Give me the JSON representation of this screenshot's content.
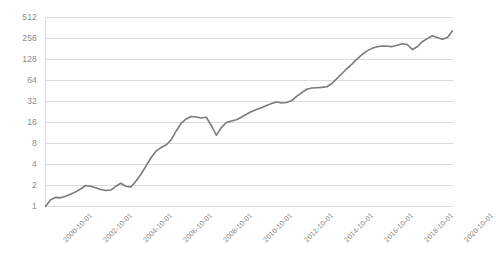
{
  "chart_data": {
    "type": "line",
    "title": "",
    "subtitle": "",
    "xlabel": "",
    "ylabel": "",
    "grid": true,
    "legend": false,
    "yscale": "log2",
    "ylim": [
      1,
      512
    ],
    "yticks": [
      1,
      2,
      4,
      8,
      16,
      32,
      64,
      128,
      256,
      512
    ],
    "ytick_labels": [
      "1",
      "2",
      "4",
      "8",
      "16",
      "32",
      "64",
      "128",
      "256",
      "512"
    ],
    "xtick_labels": [
      "2000-10-01",
      "2002-10-01",
      "2004-10-01",
      "2006-10-01",
      "2008-10-01",
      "2010-10-01",
      "2012-10-01",
      "2014-10-01",
      "2016-10-01",
      "2018-10-01",
      "2020-10-01"
    ],
    "xlim": [
      "2000-10-01",
      "2021-01-01"
    ],
    "series": [
      {
        "name": "value",
        "color": "#7a7a7a",
        "x": [
          "2000-10-01",
          "2001-01-01",
          "2001-04-01",
          "2001-07-01",
          "2001-10-01",
          "2002-01-01",
          "2002-04-01",
          "2002-07-01",
          "2002-10-01",
          "2003-01-01",
          "2003-04-01",
          "2003-07-01",
          "2003-10-01",
          "2004-01-01",
          "2004-04-01",
          "2004-07-01",
          "2004-10-01",
          "2005-01-01",
          "2005-04-01",
          "2005-07-01",
          "2005-10-01",
          "2006-01-01",
          "2006-04-01",
          "2006-07-01",
          "2006-10-01",
          "2007-01-01",
          "2007-04-01",
          "2007-07-01",
          "2007-10-01",
          "2008-01-01",
          "2008-04-01",
          "2008-07-01",
          "2008-10-01",
          "2009-01-01",
          "2009-04-01",
          "2009-07-01",
          "2009-10-01",
          "2010-01-01",
          "2010-04-01",
          "2010-07-01",
          "2010-10-01",
          "2011-01-01",
          "2011-04-01",
          "2011-07-01",
          "2011-10-01",
          "2012-01-01",
          "2012-04-01",
          "2012-07-01",
          "2012-10-01",
          "2013-01-01",
          "2013-04-01",
          "2013-07-01",
          "2013-10-01",
          "2014-01-01",
          "2014-04-01",
          "2014-07-01",
          "2014-10-01",
          "2015-01-01",
          "2015-04-01",
          "2015-07-01",
          "2015-10-01",
          "2016-01-01",
          "2016-04-01",
          "2016-07-01",
          "2016-10-01",
          "2017-01-01",
          "2017-04-01",
          "2017-07-01",
          "2017-10-01",
          "2018-01-01",
          "2018-04-01",
          "2018-07-01",
          "2018-10-01",
          "2019-01-01",
          "2019-04-01",
          "2019-07-01",
          "2019-10-01",
          "2020-01-01",
          "2020-04-01",
          "2020-07-01",
          "2020-10-01",
          "2021-01-01"
        ],
        "values": [
          1.0,
          1.25,
          1.35,
          1.33,
          1.4,
          1.5,
          1.62,
          1.78,
          2.0,
          1.95,
          1.85,
          1.75,
          1.7,
          1.72,
          1.95,
          2.15,
          1.95,
          1.9,
          2.3,
          2.9,
          3.8,
          5.0,
          6.2,
          7.0,
          7.6,
          9.0,
          12.0,
          15.5,
          18.0,
          19.5,
          19.2,
          18.6,
          19.0,
          14.5,
          10.5,
          13.5,
          16.0,
          16.8,
          17.5,
          19.0,
          21.0,
          23.0,
          24.5,
          26.0,
          28.0,
          30.0,
          31.5,
          30.5,
          31.0,
          33.0,
          38.0,
          43.0,
          48.0,
          50.0,
          50.5,
          51.0,
          52.0,
          58.0,
          68.0,
          80.0,
          95.0,
          110.0,
          130.0,
          150.0,
          170.0,
          185.0,
          195.0,
          200.0,
          198.0,
          196.0,
          205.0,
          215.0,
          210.0,
          178.0,
          195.0,
          230.0,
          255.0,
          280.0,
          265.0,
          250.0,
          265.0,
          330.0
        ]
      }
    ]
  },
  "axes": {
    "y_tick_labels": [
      "512",
      "256",
      "128",
      "64",
      "32",
      "16",
      "8",
      "4",
      "2",
      "1"
    ],
    "x_tick_labels": [
      "2000-10-01",
      "2002-10-01",
      "2004-10-01",
      "2006-10-01",
      "2008-10-01",
      "2010-10-01",
      "2012-10-01",
      "2014-10-01",
      "2016-10-01",
      "2018-10-01",
      "2020-10-01"
    ]
  },
  "style": {
    "line_color": "#7a7a7a",
    "grid_color": "#dcdcdc",
    "axis_text_color": "#8c8c8c",
    "background": "#ffffff"
  }
}
